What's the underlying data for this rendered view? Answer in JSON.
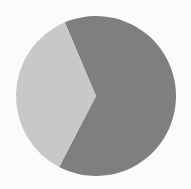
{
  "chart_data": {
    "type": "pie",
    "title": "",
    "subtitle": "",
    "xlabel": "",
    "ylabel": "",
    "grid": false,
    "legend": false,
    "legend_position": "none",
    "labels_shown": false,
    "background_color": "#fbfbfb",
    "center_x": 96,
    "center_y": 96,
    "radius": 80,
    "start_angle_deg": 113,
    "direction": "counterclockwise",
    "categories": [
      "Slice 1",
      "Slice 2"
    ],
    "values": [
      64,
      36
    ],
    "percentages": [
      "64%",
      "36%"
    ],
    "colors": [
      "#7f7f7f",
      "#c8c8c8"
    ],
    "slices": [
      {
        "name": "Slice 1",
        "value": 64,
        "percent": "64%",
        "color": "#7f7f7f",
        "angle_deg": 230.4,
        "start_deg": 113,
        "end_deg": -117.4
      },
      {
        "name": "Slice 2",
        "value": 36,
        "percent": "36%",
        "color": "#c8c8c8",
        "angle_deg": 129.6,
        "start_deg": -117.4,
        "end_deg": -247
      }
    ]
  },
  "figure": {
    "width": 191,
    "height": 189
  }
}
